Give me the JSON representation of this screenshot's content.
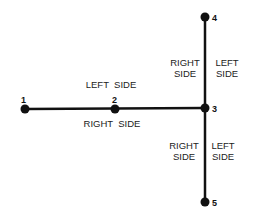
{
  "diagram": {
    "line_color": "#111111",
    "nodes": [
      {
        "id": "1",
        "x": 25,
        "y": 109
      },
      {
        "id": "2",
        "x": 115,
        "y": 109
      },
      {
        "id": "3",
        "x": 205,
        "y": 108
      },
      {
        "id": "4",
        "x": 205,
        "y": 17
      },
      {
        "id": "5",
        "x": 205,
        "y": 202
      }
    ],
    "edges": [
      [
        "1",
        "2"
      ],
      [
        "2",
        "3"
      ],
      [
        "4",
        "3"
      ],
      [
        "3",
        "5"
      ]
    ],
    "labels": {
      "horizontal_top": "LEFT  SIDE",
      "horizontal_bottom": "RIGHT  SIDE",
      "upper_left_line1": "RIGHT",
      "upper_left_line2": "SIDE",
      "upper_right_line1": "LEFT",
      "upper_right_line2": "SIDE",
      "lower_left_line1": "RIGHT",
      "lower_left_line2": "SIDE",
      "lower_right_line1": "LEFT",
      "lower_right_line2": "SIDE"
    }
  }
}
